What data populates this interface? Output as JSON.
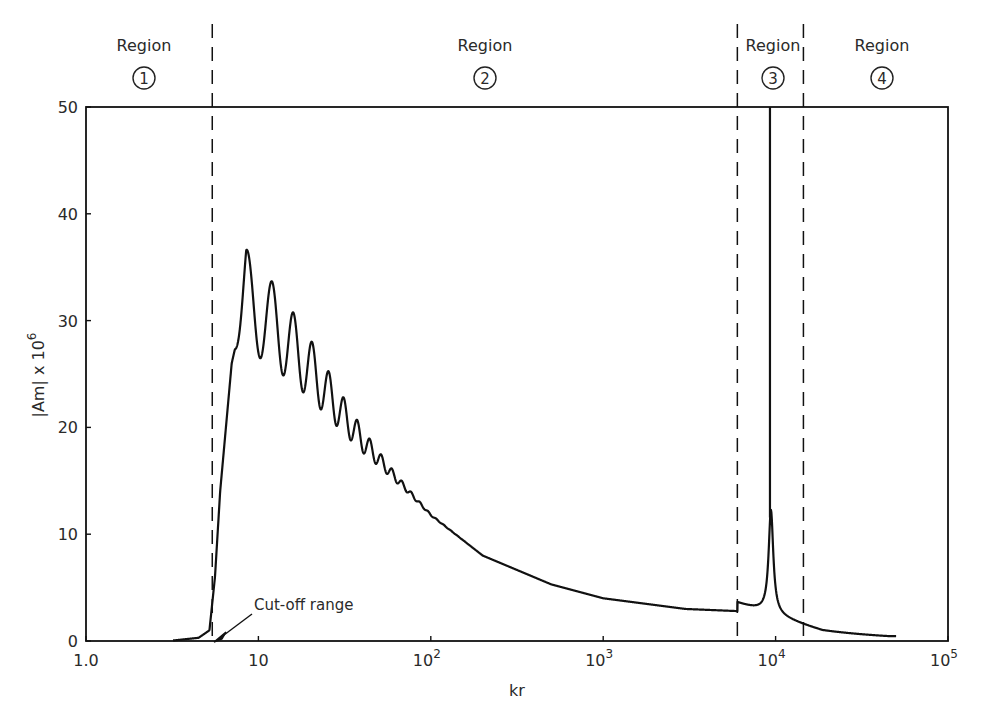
{
  "chart_data": {
    "type": "line",
    "title": "",
    "xlabel": "kr",
    "ylabel": "|Am| x 10^6",
    "ylabel_parts": {
      "main": "|Am| x 10",
      "exp": "6"
    },
    "x_scale": "log",
    "xlim": [
      1,
      100000
    ],
    "ylim": [
      0,
      50
    ],
    "grid": false,
    "x_ticks": [
      {
        "value": 1,
        "label": "1.0",
        "base": "1.0",
        "exp": ""
      },
      {
        "value": 10,
        "label": "10",
        "base": "10",
        "exp": ""
      },
      {
        "value": 100,
        "label": "10^2",
        "base": "10",
        "exp": "2"
      },
      {
        "value": 1000,
        "label": "10^3",
        "base": "10",
        "exp": "3"
      },
      {
        "value": 10000,
        "label": "10^4",
        "base": "10",
        "exp": "4"
      },
      {
        "value": 100000,
        "label": "10^5",
        "base": "10",
        "exp": "5"
      }
    ],
    "y_ticks": [
      {
        "value": 0,
        "label": "0"
      },
      {
        "value": 10,
        "label": "10"
      },
      {
        "value": 20,
        "label": "20"
      },
      {
        "value": 30,
        "label": "30"
      },
      {
        "value": 40,
        "label": "40"
      },
      {
        "value": 50,
        "label": "50"
      }
    ],
    "regions": [
      {
        "label": "Region",
        "number": "1"
      },
      {
        "label": "Region",
        "number": "2"
      },
      {
        "label": "Region",
        "number": "3"
      },
      {
        "label": "Region",
        "number": "4"
      }
    ],
    "region_boundaries_kr": [
      5.4,
      6000,
      14500
    ],
    "annotation": {
      "text": "Cut-off range",
      "kr": 5.5,
      "y": 0
    },
    "series": [
      {
        "name": "|Am|",
        "x": [
          3.0,
          4.5,
          5.2,
          5.6,
          6.0,
          7.0,
          8.5,
          10.2,
          12.0,
          14.0,
          15.5,
          17.5,
          19.0,
          21.0,
          23.0,
          26.0,
          30.0,
          40.0,
          60.0,
          100.0,
          200.0,
          500.0,
          1000.0,
          3000.0,
          6000.0,
          8000.0,
          9400.0,
          9600.0,
          11000.0,
          15000.0,
          25000.0,
          50000.0
        ],
        "values": [
          0,
          0.3,
          1.0,
          6.0,
          14.0,
          28.0,
          36.8,
          27.8,
          34.3,
          26.0,
          31.5,
          24.8,
          29.0,
          23.0,
          25.5,
          22.5,
          21.5,
          18.5,
          15.5,
          11.8,
          8.0,
          5.3,
          4.0,
          3.0,
          2.8,
          4.0,
          12.5,
          50,
          3.5,
          1.4,
          0.8,
          0.5
        ]
      }
    ],
    "spike": {
      "kr": 9400,
      "y_upper_clipped": 50,
      "y_secondary_peak": 12.5
    }
  },
  "plot": {
    "x_label": "kr",
    "cutoff_label": "Cut-off range"
  }
}
